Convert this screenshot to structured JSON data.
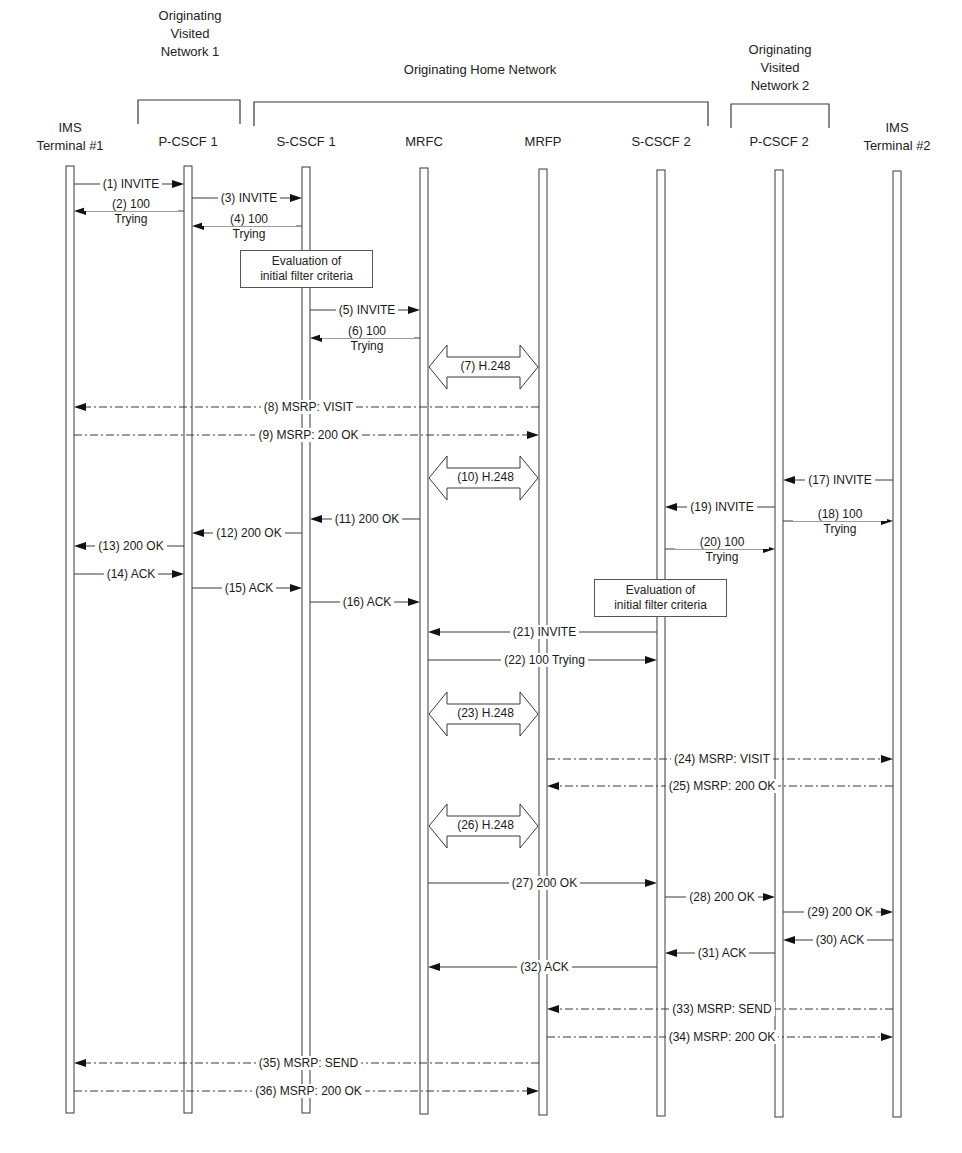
{
  "groups": [
    {
      "id": "ovn1",
      "label": "Originating\nVisited\nNetwork 1",
      "line1": "Originating",
      "line2": "Visited",
      "line3": "Network 1",
      "x1": 138,
      "x2": 240,
      "label_x": 190,
      "label_y": 8
    },
    {
      "id": "ohn",
      "label": "Originating Home Network",
      "line1": "Originating Home Network",
      "x1": 254,
      "x2": 708,
      "label_x": 480,
      "label_y": 62
    },
    {
      "id": "ovn2",
      "label": "Originating\nVisited\nNetwork 2",
      "line1": "Originating",
      "line2": "Visited",
      "line3": "Network 2",
      "x1": 731,
      "x2": 829,
      "label_x": 780,
      "label_y": 42
    }
  ],
  "entities": [
    {
      "id": "t1",
      "line1": "IMS",
      "line2": "Terminal #1",
      "x": 70,
      "top": 166,
      "bottom": 1113
    },
    {
      "id": "p1",
      "line1": "P-CSCF 1",
      "line2": "",
      "x": 188,
      "top": 166,
      "bottom": 1113
    },
    {
      "id": "s1",
      "line1": "S-CSCF 1",
      "line2": "",
      "x": 306,
      "top": 167,
      "bottom": 1113
    },
    {
      "id": "mrfc",
      "line1": "MRFC",
      "line2": "",
      "x": 424,
      "top": 168,
      "bottom": 1114
    },
    {
      "id": "mrfp",
      "line1": "MRFP",
      "line2": "",
      "x": 543,
      "top": 169,
      "bottom": 1115
    },
    {
      "id": "s2",
      "line1": "S-CSCF 2",
      "line2": "",
      "x": 661,
      "top": 170,
      "bottom": 1116
    },
    {
      "id": "p2",
      "line1": "P-CSCF 2",
      "line2": "",
      "x": 779,
      "top": 170,
      "bottom": 1117
    },
    {
      "id": "t2",
      "line1": "IMS",
      "line2": "Terminal #2",
      "x": 897,
      "top": 171,
      "bottom": 1117
    }
  ],
  "notes": [
    {
      "id": "ifc1",
      "line1": "Evaluation of",
      "line2": "initial filter criteria",
      "x": 240,
      "y": 250,
      "w": 133,
      "h": 38
    },
    {
      "id": "ifc2",
      "line1": "Evaluation of",
      "line2": "initial filter criteria",
      "x": 594,
      "y": 579,
      "w": 133,
      "h": 38
    }
  ],
  "messages": [
    {
      "n": 1,
      "label": "(1) INVITE",
      "from": "t1",
      "to": "p1",
      "y": 184,
      "style": "solid"
    },
    {
      "n": 2,
      "label": "(2) 100",
      "label2": "Trying",
      "from": "p1",
      "to": "t1",
      "y": 211,
      "style": "solid"
    },
    {
      "n": 3,
      "label": "(3) INVITE",
      "from": "p1",
      "to": "s1",
      "y": 198,
      "style": "solid"
    },
    {
      "n": 4,
      "label": "(4) 100",
      "label2": "Trying",
      "from": "s1",
      "to": "p1",
      "y": 226,
      "style": "solid"
    },
    {
      "n": 5,
      "label": "(5) INVITE",
      "from": "s1",
      "to": "mrfc",
      "y": 310,
      "style": "solid"
    },
    {
      "n": 6,
      "label": "(6) 100",
      "label2": "Trying",
      "from": "mrfc",
      "to": "s1",
      "y": 338,
      "style": "solid"
    },
    {
      "n": 7,
      "label": "(7) H.248",
      "from": "mrfc",
      "to": "mrfp",
      "y": 367,
      "style": "h248"
    },
    {
      "n": 8,
      "label": "(8) MSRP: VISIT",
      "from": "mrfp",
      "to": "t1",
      "y": 407,
      "style": "dashdot"
    },
    {
      "n": 9,
      "label": "(9) MSRP: 200 OK",
      "from": "t1",
      "to": "mrfp",
      "y": 435,
      "style": "dashdot"
    },
    {
      "n": 10,
      "label": "(10) H.248",
      "from": "mrfc",
      "to": "mrfp",
      "y": 478,
      "style": "h248"
    },
    {
      "n": 11,
      "label": "(11) 200 OK",
      "from": "mrfc",
      "to": "s1",
      "y": 519,
      "style": "solid"
    },
    {
      "n": 12,
      "label": "(12) 200 OK",
      "from": "s1",
      "to": "p1",
      "y": 533,
      "style": "solid"
    },
    {
      "n": 13,
      "label": "(13) 200 OK",
      "from": "p1",
      "to": "t1",
      "y": 546,
      "style": "solid"
    },
    {
      "n": 14,
      "label": "(14) ACK",
      "from": "t1",
      "to": "p1",
      "y": 574,
      "style": "solid"
    },
    {
      "n": 15,
      "label": "(15) ACK",
      "from": "p1",
      "to": "s1",
      "y": 588,
      "style": "solid"
    },
    {
      "n": 16,
      "label": "(16) ACK",
      "from": "s1",
      "to": "mrfc",
      "y": 602,
      "style": "solid"
    },
    {
      "n": 17,
      "label": "(17) INVITE",
      "from": "t2",
      "to": "p2",
      "y": 480,
      "style": "solid"
    },
    {
      "n": 18,
      "label": "(18) 100",
      "label2": "Trying",
      "from": "p2",
      "to": "t2",
      "y": 521,
      "style": "solid"
    },
    {
      "n": 19,
      "label": "(19) INVITE",
      "from": "p2",
      "to": "s2",
      "y": 507,
      "style": "solid"
    },
    {
      "n": 20,
      "label": "(20) 100",
      "label2": "Trying",
      "from": "s2",
      "to": "p2",
      "y": 549,
      "style": "solid"
    },
    {
      "n": 21,
      "label": "(21) INVITE",
      "from": "s2",
      "to": "mrfc",
      "y": 632,
      "style": "solid"
    },
    {
      "n": 22,
      "label": "(22) 100 Trying",
      "from": "mrfc",
      "to": "s2",
      "y": 660,
      "style": "solid"
    },
    {
      "n": 23,
      "label": "(23) H.248",
      "from": "mrfc",
      "to": "mrfp",
      "y": 714,
      "style": "h248"
    },
    {
      "n": 24,
      "label": "(24) MSRP: VISIT",
      "from": "mrfp",
      "to": "t2",
      "y": 759,
      "style": "dashdot"
    },
    {
      "n": 25,
      "label": "(25) MSRP: 200 OK",
      "from": "t2",
      "to": "mrfp",
      "y": 786,
      "style": "dashdot"
    },
    {
      "n": 26,
      "label": "(26) H.248",
      "from": "mrfc",
      "to": "mrfp",
      "y": 826,
      "style": "h248"
    },
    {
      "n": 27,
      "label": "(27) 200 OK",
      "from": "mrfc",
      "to": "s2",
      "y": 883,
      "style": "solid"
    },
    {
      "n": 28,
      "label": "(28) 200 OK",
      "from": "s2",
      "to": "p2",
      "y": 897,
      "style": "solid"
    },
    {
      "n": 29,
      "label": "(29) 200 OK",
      "from": "p2",
      "to": "t2",
      "y": 912,
      "style": "solid"
    },
    {
      "n": 30,
      "label": "(30) ACK",
      "from": "t2",
      "to": "p2",
      "y": 940,
      "style": "solid"
    },
    {
      "n": 31,
      "label": "(31) ACK",
      "from": "p2",
      "to": "s2",
      "y": 953,
      "style": "solid"
    },
    {
      "n": 32,
      "label": "(32) ACK",
      "from": "s2",
      "to": "mrfc",
      "y": 967,
      "style": "solid"
    },
    {
      "n": 33,
      "label": "(33) MSRP: SEND",
      "from": "t2",
      "to": "mrfp",
      "y": 1009,
      "style": "dashdot"
    },
    {
      "n": 34,
      "label": "(34) MSRP: 200 OK",
      "from": "mrfp",
      "to": "t2",
      "y": 1037,
      "style": "dashdot"
    },
    {
      "n": 35,
      "label": "(35) MSRP: SEND",
      "from": "mrfp",
      "to": "t1",
      "y": 1063,
      "style": "dashdot"
    },
    {
      "n": 36,
      "label": "(36) MSRP: 200 OK",
      "from": "t1",
      "to": "mrfp",
      "y": 1091,
      "style": "dashdot"
    }
  ],
  "colors": {
    "line": "#3a3a3a",
    "text": "#1a1a1a",
    "background": "#ffffff"
  }
}
